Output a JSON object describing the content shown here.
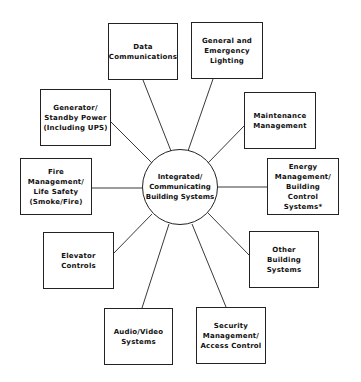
{
  "diagram": {
    "type": "hub-and-spoke",
    "hub": {
      "label": "Integrated/\nCommunicating\nBuilding Systems",
      "cx": 180,
      "cy": 187,
      "r": 38
    },
    "nodes": [
      {
        "id": "data-communications",
        "label": "Data\nCommunications",
        "x": 108,
        "y": 23,
        "w": 70,
        "h": 57,
        "lx1": 143,
        "ly1": 80,
        "lx2": 171,
        "ly2": 151
      },
      {
        "id": "general-emergency-lighting",
        "label": "General and\nEmergency\nLighting",
        "x": 191,
        "y": 22,
        "w": 72,
        "h": 57,
        "lx1": 213,
        "ly1": 79,
        "lx2": 188,
        "ly2": 151
      },
      {
        "id": "generator-standby-power",
        "label": "Generator/\nStandby Power\n(Including UPS)",
        "x": 40,
        "y": 89,
        "w": 71,
        "h": 57,
        "lx1": 111,
        "ly1": 122,
        "lx2": 152,
        "ly2": 163
      },
      {
        "id": "maintenance-management",
        "label": "Maintenance\nManagement",
        "x": 244,
        "y": 92,
        "w": 72,
        "h": 57,
        "lx1": 244,
        "ly1": 126,
        "lx2": 208,
        "ly2": 163
      },
      {
        "id": "fire-management-life-safety",
        "label": "Fire\nManagement/\nLife Safety\n(Smoke/Fire)",
        "x": 20,
        "y": 158,
        "w": 72,
        "h": 57,
        "lx1": 92,
        "ly1": 188,
        "lx2": 142,
        "ly2": 188
      },
      {
        "id": "energy-management-bcs",
        "label": "Energy\nManagement/\nBuilding Control\nSystems*",
        "x": 267,
        "y": 158,
        "w": 72,
        "h": 57,
        "lx1": 267,
        "ly1": 187,
        "lx2": 218,
        "ly2": 187
      },
      {
        "id": "elevator-controls",
        "label": "Elevator\nControls",
        "x": 43,
        "y": 232,
        "w": 71,
        "h": 57,
        "lx1": 114,
        "ly1": 253,
        "lx2": 152,
        "ly2": 214
      },
      {
        "id": "other-building-systems",
        "label": "Other\nBuilding\nSystems",
        "x": 249,
        "y": 231,
        "w": 70,
        "h": 57,
        "lx1": 249,
        "ly1": 255,
        "lx2": 208,
        "ly2": 213
      },
      {
        "id": "audio-video-systems",
        "label": "Audio/Video\nSystems",
        "x": 104,
        "y": 308,
        "w": 69,
        "h": 57,
        "lx1": 142,
        "ly1": 308,
        "lx2": 169,
        "ly2": 224
      },
      {
        "id": "security-access-control",
        "label": "Security\nManagement/\nAccess Control",
        "x": 196,
        "y": 307,
        "w": 70,
        "h": 57,
        "lx1": 226,
        "ly1": 307,
        "lx2": 192,
        "ly2": 224
      }
    ],
    "colors": {
      "stroke": "#222222",
      "text": "#111111",
      "background": "#ffffff"
    }
  }
}
